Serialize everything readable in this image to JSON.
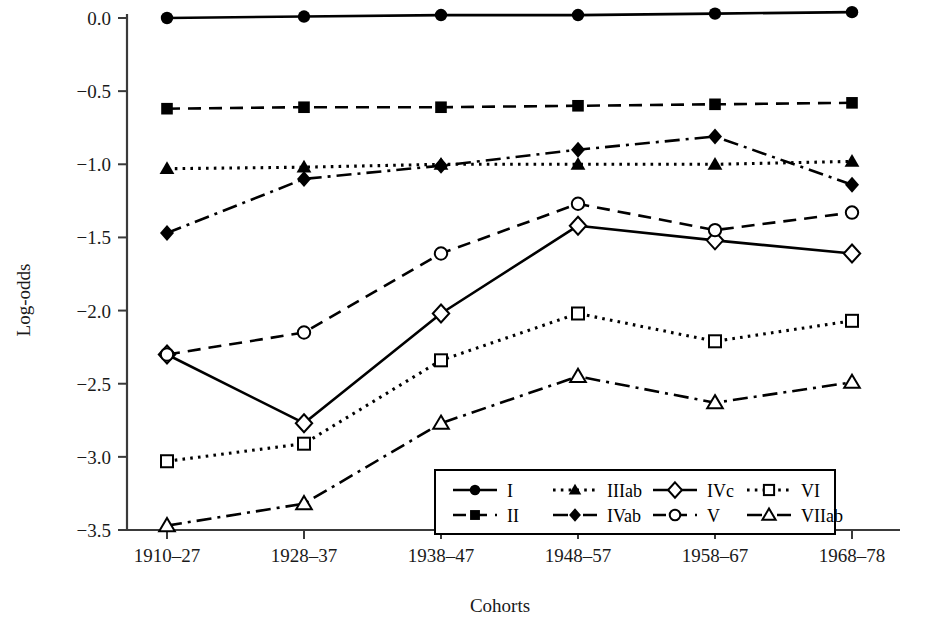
{
  "chart_data": {
    "type": "line",
    "title": "",
    "xlabel": "Cohorts",
    "ylabel": "Log-odds",
    "categories": [
      "1910–27",
      "1928–37",
      "1938–47",
      "1948–57",
      "1958–67",
      "1968–78"
    ],
    "ylim": [
      -3.5,
      0.0
    ],
    "yticks": [
      0.0,
      -0.5,
      -1.0,
      -1.5,
      -2.0,
      -2.5,
      -3.0,
      -3.5
    ],
    "ytick_labels": [
      "0.0",
      "−0.5",
      "−1.0",
      "−1.5",
      "−2.0",
      "−2.5",
      "−3.0",
      "−3.5"
    ],
    "grid": false,
    "legend_position": "inside-bottom-center",
    "series": [
      {
        "name": "I",
        "marker": "filled-circle",
        "line": "solid",
        "values": [
          0.0,
          0.01,
          0.02,
          0.02,
          0.03,
          0.04
        ]
      },
      {
        "name": "II",
        "marker": "filled-square",
        "line": "dashed",
        "values": [
          -0.62,
          -0.61,
          -0.61,
          -0.6,
          -0.59,
          -0.58
        ]
      },
      {
        "name": "IIIab",
        "marker": "filled-triangle",
        "line": "dotted",
        "values": [
          -1.03,
          -1.02,
          -1.0,
          -1.0,
          -1.0,
          -0.98
        ]
      },
      {
        "name": "IVab",
        "marker": "filled-diamond",
        "line": "dashdot",
        "values": [
          -1.47,
          -1.1,
          -1.01,
          -0.9,
          -0.81,
          -1.14
        ]
      },
      {
        "name": "IVc",
        "marker": "open-diamond",
        "line": "solid",
        "values": [
          -2.3,
          -2.77,
          -2.02,
          -1.42,
          -1.52,
          -1.61
        ]
      },
      {
        "name": "V",
        "marker": "open-circle",
        "line": "dashed",
        "values": [
          -2.3,
          -2.15,
          -1.61,
          -1.27,
          -1.45,
          -1.33
        ]
      },
      {
        "name": "VI",
        "marker": "open-square",
        "line": "dotted",
        "values": [
          -3.03,
          -2.91,
          -2.34,
          -2.02,
          -2.21,
          -2.07
        ]
      },
      {
        "name": "VIIab",
        "marker": "open-triangle",
        "line": "dashdot",
        "values": [
          -3.47,
          -3.32,
          -2.77,
          -2.45,
          -2.63,
          -2.49
        ]
      }
    ]
  },
  "legend": {
    "columns": [
      [
        {
          "name": "I"
        },
        {
          "name": "II"
        }
      ],
      [
        {
          "name": "IIIab"
        },
        {
          "name": "IVab"
        }
      ],
      [
        {
          "name": "IVc"
        },
        {
          "name": "V"
        }
      ],
      [
        {
          "name": "VI"
        },
        {
          "name": "VIIab"
        }
      ]
    ]
  },
  "axes": {
    "y_title": "Log-odds",
    "x_title": "Cohorts"
  },
  "colors": {
    "ink": "#000000",
    "axis": "#333333",
    "background": "#ffffff"
  }
}
